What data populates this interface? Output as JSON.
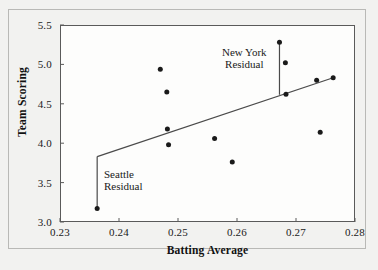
{
  "chart_data": {
    "type": "scatter",
    "title": "",
    "xlabel": "Batting Average",
    "ylabel": "Team Scoring",
    "xlim": [
      0.23,
      0.28
    ],
    "ylim": [
      3.0,
      5.5
    ],
    "xticks": [
      0.23,
      0.24,
      0.25,
      0.26,
      0.27,
      0.28
    ],
    "xtick_labels": [
      "0.23",
      "0.24",
      "0.25",
      "0.26",
      "0.27",
      "0.28"
    ],
    "yticks": [
      3.0,
      3.5,
      4.0,
      4.5,
      5.0,
      5.5
    ],
    "ytick_labels": [
      "3.0",
      "3.5",
      "4.0",
      "4.5",
      "5.0",
      "5.5"
    ],
    "grid": false,
    "legend": false,
    "marker": "filled-circle",
    "marker_color": "#1a1a1a",
    "line_color": "#4a4a4a",
    "points": [
      {
        "x": 0.2363,
        "y": 3.17
      },
      {
        "x": 0.247,
        "y": 4.94
      },
      {
        "x": 0.2481,
        "y": 4.65
      },
      {
        "x": 0.2482,
        "y": 4.18
      },
      {
        "x": 0.2484,
        "y": 3.98
      },
      {
        "x": 0.2562,
        "y": 4.06
      },
      {
        "x": 0.2592,
        "y": 3.76
      },
      {
        "x": 0.2672,
        "y": 5.28
      },
      {
        "x": 0.2682,
        "y": 5.02
      },
      {
        "x": 0.2683,
        "y": 4.62
      },
      {
        "x": 0.2735,
        "y": 4.8
      },
      {
        "x": 0.2741,
        "y": 4.14
      },
      {
        "x": 0.2763,
        "y": 4.83
      }
    ],
    "regression_line": {
      "x1": 0.2363,
      "y1": 3.83,
      "x2": 0.2763,
      "y2": 4.83
    },
    "residual_segments": [
      {
        "name": "seattle-residual",
        "x": 0.2363,
        "y_from": 3.83,
        "y_to": 3.17
      },
      {
        "name": "new-york-residual",
        "x": 0.2672,
        "y_from": 5.28,
        "y_to": 4.615
      }
    ],
    "annotations": [
      {
        "name": "new-york-residual-label",
        "text": "New York\nResidual"
      },
      {
        "name": "seattle-residual-label",
        "text": "Seattle\nResidual"
      }
    ]
  }
}
